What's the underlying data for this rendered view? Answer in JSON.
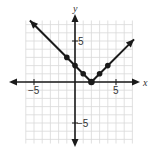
{
  "chart_data": {
    "type": "line",
    "title": "",
    "function": "y = |x - 2|",
    "xlabel": "x",
    "ylabel": "y",
    "xlim": [
      -6,
      7
    ],
    "ylim": [
      -7.5,
      7.5
    ],
    "grid": true,
    "x_tick_labels": [
      {
        "value": -5,
        "label": "−5"
      },
      {
        "value": 5,
        "label": "5"
      }
    ],
    "y_tick_labels": [
      {
        "value": 5,
        "label": "5"
      },
      {
        "value": -5,
        "label": "−5"
      }
    ],
    "series": [
      {
        "name": "y = |x - 2|",
        "line_endpoints": [
          [
            -5.5,
            7.5
          ],
          [
            7.2,
            5.2
          ]
        ],
        "points": [
          {
            "x": -1,
            "y": 3
          },
          {
            "x": 0,
            "y": 2
          },
          {
            "x": 1,
            "y": 1
          },
          {
            "x": 2,
            "y": 0
          },
          {
            "x": 3,
            "y": 1
          },
          {
            "x": 4,
            "y": 2
          }
        ]
      }
    ],
    "colors": {
      "line": "#1a1a1a",
      "grid": "#d9d9d9",
      "axis": "#1a1a1a"
    }
  },
  "labels": {
    "x_axis": "x",
    "y_axis": "y",
    "x_neg5": "−5",
    "x_pos5": "5",
    "y_pos5": "5",
    "y_neg5": "−5"
  }
}
